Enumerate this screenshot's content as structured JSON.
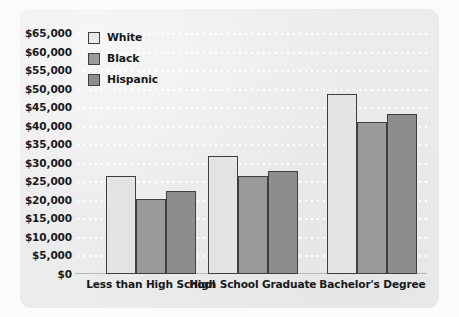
{
  "chart_data": {
    "type": "bar",
    "title": "",
    "xlabel": "",
    "ylabel": "",
    "ylim": [
      0,
      65000
    ],
    "grid": true,
    "legend_position": "top-left",
    "categories": [
      "Less than High School",
      "High School Graduate",
      "Bachelor's Degree"
    ],
    "ytick_labels": [
      "$65,000",
      "$60,000",
      "$55,000",
      "$50,000",
      "$45,000",
      "$40,000",
      "$35,000",
      "$30,000",
      "$25,000",
      "$20,000",
      "$15,000",
      "$10,000",
      "$5,000",
      "$0"
    ],
    "ytick_values": [
      65000,
      60000,
      55000,
      50000,
      45000,
      40000,
      35000,
      30000,
      25000,
      20000,
      15000,
      10000,
      5000,
      0
    ],
    "series": [
      {
        "name": "White",
        "color": "#e4e4e4",
        "values": [
          26500,
          31800,
          48500
        ]
      },
      {
        "name": "Black",
        "color": "#9a9a9a",
        "values": [
          20100,
          26500,
          41000
        ]
      },
      {
        "name": "Hispanic",
        "color": "#8d8d8d",
        "values": [
          22300,
          27800,
          43200
        ]
      }
    ]
  },
  "legend": {
    "items": [
      {
        "label": "White",
        "swatch": "white"
      },
      {
        "label": "Black",
        "swatch": "black"
      },
      {
        "label": "Hispanic",
        "swatch": "hispanic"
      }
    ]
  },
  "colors": {
    "panel_background": "#ececec",
    "page_background": "#ffffff",
    "gridline": "#ffffff",
    "bar_outline": "#3d3f42",
    "text": "#16191c"
  }
}
